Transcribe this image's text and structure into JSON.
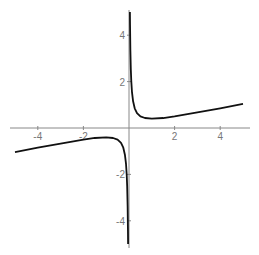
{
  "chart_data": {
    "type": "line",
    "title": "",
    "xlabel": "",
    "ylabel": "",
    "xlim": [
      -5.2,
      5.2
    ],
    "ylim": [
      -5.2,
      5.2
    ],
    "grid": false,
    "legend": null,
    "x_ticks": [
      -4,
      -2,
      2,
      4
    ],
    "x_tick_labels": [
      "-4",
      "-2",
      "2",
      "4"
    ],
    "y_ticks": [
      4,
      2,
      -2,
      -4
    ],
    "y_tick_labels": [
      "4",
      "2",
      "-2",
      "-4"
    ],
    "series": [
      {
        "name": "branch-negative",
        "x": [
          -5,
          -4,
          -3,
          -2,
          -1.5,
          -1,
          -0.7,
          -0.5,
          -0.35,
          -0.25,
          -0.18,
          -0.13,
          -0.1,
          -0.08,
          -0.06,
          -0.045,
          -0.04
        ],
        "y": [
          -1.04,
          -0.85,
          -0.67,
          -0.5,
          -0.43,
          -0.4,
          -0.43,
          -0.5,
          -0.64,
          -0.85,
          -1.15,
          -1.56,
          -2.02,
          -2.52,
          -3.35,
          -4.45,
          -5.0
        ]
      },
      {
        "name": "branch-positive",
        "x": [
          0.04,
          0.045,
          0.06,
          0.08,
          0.1,
          0.13,
          0.18,
          0.25,
          0.35,
          0.5,
          0.7,
          1,
          1.5,
          2,
          3,
          4,
          5
        ],
        "y": [
          5.0,
          4.45,
          3.35,
          2.52,
          2.02,
          1.56,
          1.15,
          0.85,
          0.64,
          0.5,
          0.43,
          0.4,
          0.43,
          0.5,
          0.67,
          0.85,
          1.04
        ]
      }
    ],
    "line_color": "#111111",
    "axis_color": "#888888"
  }
}
